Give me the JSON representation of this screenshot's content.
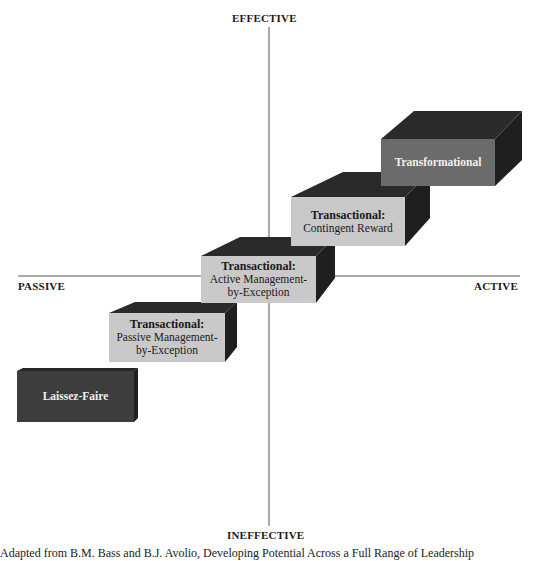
{
  "axes": {
    "top": "EFFECTIVE",
    "bottom": "INEFFECTIVE",
    "left": "PASSIVE",
    "right": "ACTIVE"
  },
  "blocks": [
    {
      "id": "laissez-faire",
      "title": "Laissez-Faire",
      "subtitle": "",
      "front_color": "#3d3d3d",
      "side_color": "#262626"
    },
    {
      "id": "passive-mbe",
      "title": "Transactional:",
      "subtitle": "Passive Management-\nby-Exception",
      "front_color": "#c9c9c9",
      "side_color": "#262626"
    },
    {
      "id": "active-mbe",
      "title": "Transactional:",
      "subtitle": "Active Management-\nby-Exception",
      "front_color": "#c9c9c9",
      "side_color": "#262626"
    },
    {
      "id": "contingent-reward",
      "title": "Transactional:",
      "subtitle": "Contingent Reward",
      "front_color": "#c9c9c9",
      "side_color": "#262626"
    },
    {
      "id": "transformational",
      "title": "Transformational",
      "subtitle": "",
      "front_color": "#6b6b6b",
      "side_color": "#262626"
    }
  ],
  "caption": "Adapted from B.M. Bass and B.J. Avolio, Developing Potential Across a Full Range of Leadership"
}
